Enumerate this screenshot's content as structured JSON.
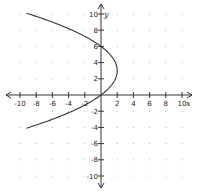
{
  "chart_data": {
    "type": "line",
    "title": "",
    "xlabel": "x",
    "ylabel": "y",
    "xlim": [
      -10,
      10
    ],
    "ylim": [
      -10,
      10
    ],
    "grid": "dots",
    "x_ticks": [
      -10,
      -8,
      -6,
      -4,
      -2,
      2,
      4,
      6,
      8,
      10
    ],
    "y_ticks": [
      10,
      8,
      6,
      4,
      2,
      -2,
      -4,
      -6,
      -8,
      -10
    ],
    "series": [
      {
        "name": "parabola",
        "equation": "x = -(2/9)(y-3)^2 + 2",
        "vertex": [
          2,
          3
        ],
        "points": [
          [
            -8.9,
            10
          ],
          [
            -3.6,
            8
          ],
          [
            0,
            6
          ],
          [
            1.8,
            4
          ],
          [
            2,
            3
          ],
          [
            1.8,
            2
          ],
          [
            0,
            0
          ],
          [
            -3.6,
            -2
          ],
          [
            -8.9,
            -4
          ]
        ]
      }
    ]
  }
}
